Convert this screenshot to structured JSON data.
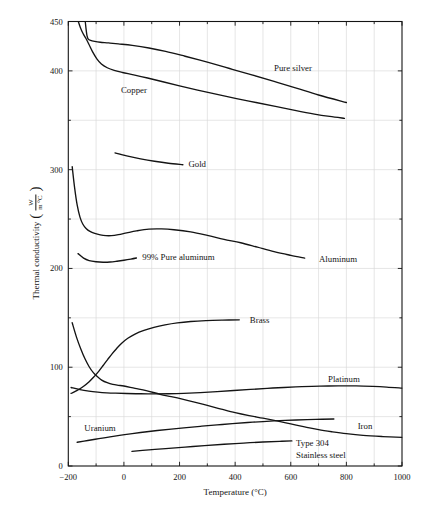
{
  "figure": {
    "x_axis": {
      "title": "Temperature (°C)",
      "min": -200,
      "max": 1000,
      "tick_values": [
        -200,
        0,
        200,
        400,
        600,
        800,
        1000
      ],
      "tick_labels": [
        "−200",
        "0",
        "200",
        "400",
        "600",
        "800",
        "1000"
      ],
      "minor_tick_values": [
        -100,
        100,
        300,
        500,
        700,
        900
      ]
    },
    "y_axis": {
      "title": "Thermal conductivity",
      "paren_open": "(",
      "paren_close": ")",
      "unit_numerator": "W",
      "unit_denominator": "m °C",
      "min": 0,
      "max": 450,
      "tick_values": [
        0,
        100,
        200,
        300,
        400,
        450
      ],
      "tick_labels": [
        "0",
        "100",
        "200",
        "300",
        "400",
        "450"
      ],
      "minor_tick_values": [
        50,
        150,
        250,
        350
      ]
    },
    "grid": {
      "x_values": [
        -100,
        0,
        100,
        200,
        300,
        400,
        500,
        600,
        700,
        800,
        900
      ],
      "y_values": [
        50,
        100,
        150,
        200,
        250,
        300,
        350,
        400
      ]
    }
  },
  "colors": {
    "curve": "#141414",
    "grid": "#d9d9d9",
    "text": "#141414",
    "background": "#ffffff"
  },
  "chart_data": {
    "type": "line",
    "title": "",
    "xlabel": "Temperature (°C)",
    "ylabel": "Thermal conductivity (W/m °C)",
    "xlim": [
      -200,
      1000
    ],
    "ylim": [
      0,
      450
    ],
    "grid": true,
    "legend": "none (inline curve labels)",
    "series": [
      {
        "name": "Pure silver",
        "points": [
          [
            -139,
            450
          ],
          [
            -136,
            442
          ],
          [
            -133,
            436
          ],
          [
            -129,
            432.5
          ],
          [
            -120,
            430.8
          ],
          [
            -105,
            429.8
          ],
          [
            -85,
            429
          ],
          [
            -55,
            428.3
          ],
          [
            -20,
            427.3
          ],
          [
            30,
            425.8
          ],
          [
            90,
            423.2
          ],
          [
            150,
            419.8
          ],
          [
            220,
            414.8
          ],
          [
            300,
            408.8
          ],
          [
            380,
            402.4
          ],
          [
            460,
            396
          ],
          [
            540,
            389.4
          ],
          [
            620,
            382.6
          ],
          [
            700,
            375.6
          ],
          [
            800,
            368
          ]
        ],
        "label": {
          "t": 608,
          "anchor": "middle",
          "lines": [
            {
              "text": "Pure silver",
              "v": 403
            }
          ]
        }
      },
      {
        "name": "Copper",
        "points": [
          [
            -164,
            450
          ],
          [
            -156,
            443.5
          ],
          [
            -147,
            437.8
          ],
          [
            -137,
            433
          ],
          [
            -126,
            427
          ],
          [
            -113,
            419.5
          ],
          [
            -98,
            412.5
          ],
          [
            -81,
            407
          ],
          [
            -60,
            403.2
          ],
          [
            -35,
            400.5
          ],
          [
            -5,
            398.4
          ],
          [
            35,
            396
          ],
          [
            85,
            392.8
          ],
          [
            140,
            389
          ],
          [
            200,
            384.8
          ],
          [
            265,
            380.5
          ],
          [
            335,
            376.2
          ],
          [
            405,
            372
          ],
          [
            475,
            368
          ],
          [
            545,
            364
          ],
          [
            615,
            360
          ],
          [
            685,
            356.3
          ],
          [
            740,
            353.9
          ],
          [
            793,
            352
          ]
        ],
        "label": {
          "t": 36,
          "anchor": "middle",
          "lines": [
            {
              "text": "Copper",
              "v": 381
            }
          ]
        }
      },
      {
        "name": "Gold",
        "points": [
          [
            -32,
            317
          ],
          [
            10,
            314
          ],
          [
            60,
            311
          ],
          [
            110,
            308.5
          ],
          [
            160,
            306.5
          ],
          [
            212,
            305
          ]
        ],
        "label": {
          "t": 232,
          "anchor": "start",
          "lines": [
            {
              "text": "Gold",
              "v": 306
            }
          ]
        }
      },
      {
        "name": "Aluminum",
        "points": [
          [
            -186,
            303
          ],
          [
            -177,
            281
          ],
          [
            -168,
            264
          ],
          [
            -158,
            252
          ],
          [
            -148,
            245
          ],
          [
            -136,
            240.5
          ],
          [
            -122,
            237.5
          ],
          [
            -105,
            235.5
          ],
          [
            -85,
            234
          ],
          [
            -65,
            233.2
          ],
          [
            -45,
            233.2
          ],
          [
            -20,
            234.2
          ],
          [
            10,
            236
          ],
          [
            45,
            238
          ],
          [
            90,
            239.8
          ],
          [
            135,
            240
          ],
          [
            180,
            239.2
          ],
          [
            240,
            237
          ],
          [
            300,
            233.5
          ],
          [
            360,
            229.5
          ],
          [
            420,
            226
          ],
          [
            480,
            221.5
          ],
          [
            540,
            217
          ],
          [
            600,
            213.3
          ],
          [
            650,
            210.5
          ]
        ],
        "label": {
          "t": 770,
          "anchor": "middle",
          "lines": [
            {
              "text": "Aluminum",
              "v": 209.5
            }
          ]
        }
      },
      {
        "name": "99% Pure aluminum",
        "points": [
          [
            -165,
            215
          ],
          [
            -145,
            210.5
          ],
          [
            -125,
            208
          ],
          [
            -100,
            206.8
          ],
          [
            -75,
            206.3
          ],
          [
            -50,
            206.5
          ],
          [
            -25,
            207.3
          ],
          [
            0,
            208.3
          ],
          [
            25,
            209.5
          ],
          [
            45,
            210.6
          ]
        ],
        "label": {
          "t": 66,
          "anchor": "start",
          "lines": [
            {
              "text": "99% Pure aluminum",
              "v": 211.5
            }
          ]
        }
      },
      {
        "name": "Brass",
        "points": [
          [
            -190,
            73.5
          ],
          [
            -168,
            76.5
          ],
          [
            -146,
            80.5
          ],
          [
            -125,
            85.3
          ],
          [
            -107,
            90.5
          ],
          [
            -90,
            96
          ],
          [
            -74,
            102
          ],
          [
            -58,
            108
          ],
          [
            -42,
            113.8
          ],
          [
            -26,
            119
          ],
          [
            -8,
            124.3
          ],
          [
            14,
            129.3
          ],
          [
            40,
            133.6
          ],
          [
            72,
            137.3
          ],
          [
            108,
            140.4
          ],
          [
            148,
            142.9
          ],
          [
            192,
            144.9
          ],
          [
            240,
            146.3
          ],
          [
            295,
            147.2
          ],
          [
            355,
            147.7
          ],
          [
            415,
            148
          ]
        ],
        "label": {
          "t": 488,
          "anchor": "middle",
          "lines": [
            {
              "text": "Brass",
              "v": 148
            }
          ]
        }
      },
      {
        "name": "Platinum",
        "points": [
          [
            -190,
            79.5
          ],
          [
            -158,
            77.3
          ],
          [
            -126,
            75.8
          ],
          [
            -94,
            74.8
          ],
          [
            -62,
            74.1
          ],
          [
            -30,
            73.7
          ],
          [
            10,
            73.4
          ],
          [
            60,
            73.1
          ],
          [
            110,
            73
          ],
          [
            160,
            73.1
          ],
          [
            215,
            73.5
          ],
          [
            275,
            74.3
          ],
          [
            335,
            75.3
          ],
          [
            395,
            76.4
          ],
          [
            455,
            77.5
          ],
          [
            515,
            78.6
          ],
          [
            575,
            79.5
          ],
          [
            640,
            80.3
          ],
          [
            705,
            80.8
          ],
          [
            770,
            81.1
          ],
          [
            835,
            81.1
          ],
          [
            895,
            80.6
          ],
          [
            945,
            79.9
          ],
          [
            1000,
            78.8
          ]
        ],
        "label": {
          "t": 791,
          "anchor": "middle",
          "lines": [
            {
              "text": "Platinum",
              "v": 88
            }
          ]
        }
      },
      {
        "name": "Iron",
        "points": [
          [
            -186,
            145
          ],
          [
            -170,
            130
          ],
          [
            -155,
            118.5
          ],
          [
            -140,
            108.5
          ],
          [
            -125,
            100.5
          ],
          [
            -110,
            94.5
          ],
          [
            -95,
            90.3
          ],
          [
            -80,
            87
          ],
          [
            -60,
            84.3
          ],
          [
            -40,
            82.6
          ],
          [
            -20,
            81.7
          ],
          [
            0,
            81
          ],
          [
            40,
            78.6
          ],
          [
            80,
            76.3
          ],
          [
            130,
            72.6
          ],
          [
            170,
            70.2
          ],
          [
            210,
            67.7
          ],
          [
            250,
            65
          ],
          [
            300,
            61.3
          ],
          [
            350,
            57.6
          ],
          [
            400,
            54
          ],
          [
            450,
            51
          ],
          [
            500,
            48.4
          ],
          [
            550,
            45.6
          ],
          [
            600,
            42.6
          ],
          [
            650,
            39.7
          ],
          [
            700,
            36.8
          ],
          [
            750,
            34.6
          ],
          [
            800,
            32.7
          ],
          [
            860,
            31
          ],
          [
            930,
            29.8
          ],
          [
            1000,
            28.9
          ]
        ],
        "label": {
          "t": 867,
          "anchor": "middle",
          "lines": [
            {
              "text": "Iron",
              "v": 40
            }
          ]
        }
      },
      {
        "name": "Uranium",
        "points": [
          [
            -168,
            24
          ],
          [
            -130,
            25.8
          ],
          [
            -90,
            27.7
          ],
          [
            -50,
            29.5
          ],
          [
            -10,
            31.2
          ],
          [
            30,
            32.8
          ],
          [
            75,
            34.4
          ],
          [
            120,
            35.9
          ],
          [
            170,
            37.4
          ],
          [
            225,
            38.9
          ],
          [
            280,
            40.3
          ],
          [
            335,
            41.6
          ],
          [
            390,
            42.9
          ],
          [
            445,
            44
          ],
          [
            500,
            45
          ],
          [
            560,
            45.9
          ],
          [
            620,
            46.6
          ],
          [
            690,
            47.2
          ],
          [
            755,
            47.6
          ]
        ],
        "label": {
          "t": -86,
          "anchor": "middle",
          "lines": [
            {
              "text": "Uranium",
              "v": 38
            }
          ]
        }
      },
      {
        "name": "Type 304 Stainless steel",
        "points": [
          [
            29,
            14.8
          ],
          [
            90,
            16.3
          ],
          [
            150,
            17.6
          ],
          [
            220,
            19.1
          ],
          [
            290,
            20.6
          ],
          [
            360,
            22
          ],
          [
            430,
            23.2
          ],
          [
            500,
            24.3
          ],
          [
            560,
            25
          ],
          [
            604,
            25.4
          ]
        ],
        "label": {
          "t": 619,
          "anchor": "start",
          "lines": [
            {
              "text": "Type 304",
              "v": 23.3
            },
            {
              "text": "Stainless steel",
              "v": 11.3
            }
          ]
        }
      }
    ]
  }
}
